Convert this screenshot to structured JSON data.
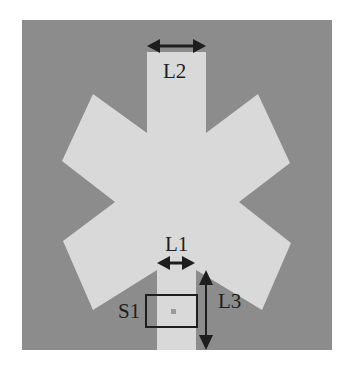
{
  "diagram": {
    "type": "antenna-geometry",
    "colors": {
      "page_background": "#ffffff",
      "substrate": "#8c8c8c",
      "patch": "#d9d9d9",
      "annotation": "#1e1e1e",
      "feed_point": "#9a9a9a"
    },
    "labels": {
      "L1": "L1",
      "L2": "L2",
      "L3": "L3",
      "S1": "S1"
    },
    "dimensions": [
      {
        "name": "L1",
        "description": "feed-line width",
        "arrow": "horizontal"
      },
      {
        "name": "L2",
        "description": "top arm width",
        "arrow": "horizontal"
      },
      {
        "name": "L3",
        "description": "feed-line length",
        "arrow": "vertical"
      }
    ],
    "regions": [
      {
        "name": "S1",
        "description": "feed region box"
      }
    ]
  }
}
